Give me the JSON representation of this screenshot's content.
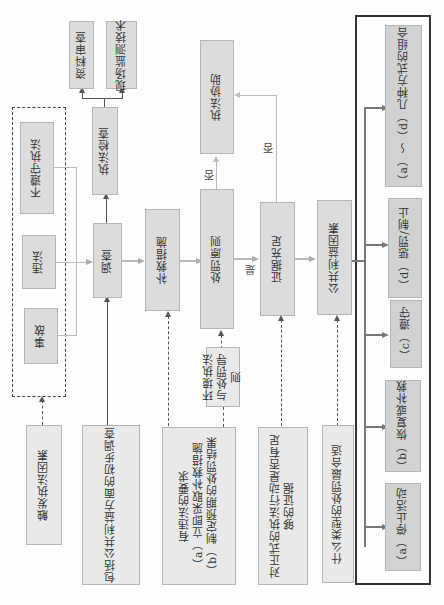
{
  "orientation": "rotated 90° counter-clockwise",
  "triggers": {
    "group_label": "触发执法因素",
    "items": [
      "不遵守执法",
      "违法",
      "事故"
    ]
  },
  "initial_investigation": "包括公共利益方面的初步调查",
  "investigation": "调查",
  "enforcement_check": "执法检查",
  "check_methods": [
    "资料审查",
    "现场监测技术"
  ],
  "remedial": "补救措施",
  "remedial_note": {
    "title": "有违法的要求",
    "a": "（a）立即采取补救措施",
    "b": "（b）制定预期的处罚结果"
  },
  "penalty_principle": "处罚原则",
  "guideline": "环境执法与处罚导则",
  "enforcement_assist": "执法协助",
  "evidence": "证据充足",
  "evidence_note": "对正式的执法行动是否有足够的证据",
  "public_interest": "公共利益因素",
  "penalty_type_note": "什么类型的处罚最合适",
  "labels": {
    "yes": "是",
    "no1": "否",
    "no2": "否"
  },
  "outcomes": [
    "（a）停止活动",
    "（b）恢复或补救",
    "（c）遵守",
    "（d）惩罚/制止",
    "（a）～（d）几种方式的组合"
  ]
}
